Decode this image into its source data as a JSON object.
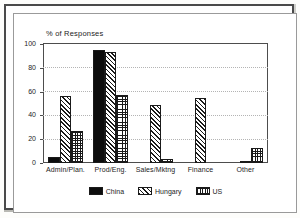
{
  "chart_data": {
    "type": "bar",
    "title": "",
    "subtitle": "",
    "xlabel": "",
    "ylabel": "% of Responses",
    "ylim": [
      0,
      100
    ],
    "ytick_labels": [
      "0",
      "20",
      "40",
      "60",
      "80",
      "100"
    ],
    "ytick_values": [
      0,
      20,
      40,
      60,
      80,
      100
    ],
    "grid": true,
    "grid_axis": "y",
    "legend_position": "bottom-center",
    "categories": [
      "Admin/Plan.",
      "Prod/Eng.",
      "Sales/Mktng",
      "Finance",
      "Other"
    ],
    "series": [
      {
        "name": "China",
        "pattern": "solid-black",
        "values": [
          5,
          95,
          0,
          0,
          0
        ]
      },
      {
        "name": "Hungary",
        "pattern": "diagonal-hatch",
        "values": [
          56,
          93,
          49,
          55,
          1
        ]
      },
      {
        "name": "US",
        "pattern": "cross-hatch",
        "values": [
          27,
          57,
          3,
          0,
          13
        ]
      }
    ]
  },
  "colors": {
    "china": "#0d0d0d",
    "hatch": "#1a1a1a",
    "axis": "#4d4d4d",
    "grid": "#b4b4b4",
    "frame": "#4a4a4a",
    "background": "#ffffff"
  }
}
